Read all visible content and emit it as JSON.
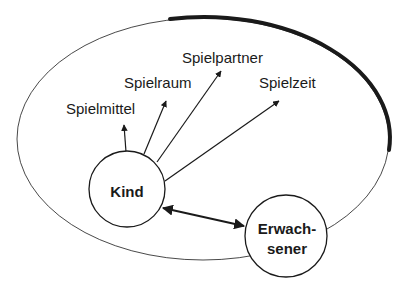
{
  "diagram": {
    "type": "concept-diagram",
    "colors": {
      "stroke": "#1a1a1a",
      "background": "#ffffff"
    },
    "nodes": {
      "child": {
        "label": "Kind"
      },
      "adult": {
        "label_line1": "Erwach-",
        "label_line2": "sener"
      }
    },
    "targets": [
      {
        "label": "Spielmittel"
      },
      {
        "label": "Spielraum"
      },
      {
        "label": "Spielpartner"
      },
      {
        "label": "Spielzeit"
      }
    ],
    "edges": [
      {
        "from": "Kind",
        "to": "Spielmittel",
        "type": "arrow"
      },
      {
        "from": "Kind",
        "to": "Spielraum",
        "type": "arrow"
      },
      {
        "from": "Kind",
        "to": "Spielpartner",
        "type": "arrow"
      },
      {
        "from": "Kind",
        "to": "Spielzeit",
        "type": "arrow"
      },
      {
        "from": "Kind",
        "to": "Erwachsener",
        "type": "double-arrow"
      }
    ]
  }
}
